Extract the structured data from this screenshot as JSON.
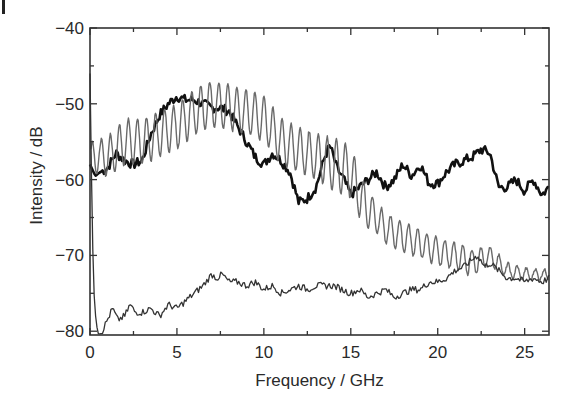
{
  "chart_data": {
    "type": "line",
    "title": "",
    "xlabel": "Frequency / GHz",
    "ylabel": "Intensity / dB",
    "xlim": [
      0,
      26.4
    ],
    "ylim": [
      -80.5,
      -40
    ],
    "xticks": [
      0,
      5,
      10,
      15,
      20,
      25
    ],
    "xtick_labels": [
      "0",
      "5",
      "10",
      "15",
      "20",
      "25"
    ],
    "yticks": [
      -40,
      -50,
      -60,
      -70,
      -80
    ],
    "ytick_labels": [
      "−40",
      "−50",
      "−60",
      "−70",
      "−80"
    ],
    "grid": false,
    "legend": "none",
    "series": [
      {
        "name": "thick-black",
        "color": "#111111",
        "width": 2.6,
        "x": [
          0,
          0.3,
          0.6,
          1,
          1.5,
          2,
          2.5,
          3,
          3.5,
          4,
          4.5,
          5,
          5.5,
          6,
          6.5,
          7,
          7.5,
          8,
          8.5,
          9,
          9.5,
          10,
          10.5,
          11,
          11.5,
          12,
          12.5,
          13,
          13.5,
          13.8,
          14.2,
          14.6,
          15,
          15.5,
          16,
          16.5,
          17,
          17.5,
          18,
          18.5,
          19,
          19.5,
          20,
          20.5,
          21,
          21.5,
          22,
          22.5,
          23,
          23.5,
          24,
          24.5,
          25,
          25.5,
          26,
          26.4
        ],
        "values": [
          -58,
          -59.5,
          -59,
          -58.5,
          -56.5,
          -57.5,
          -58,
          -57.5,
          -54,
          -51.5,
          -50,
          -49,
          -49.5,
          -49.5,
          -50,
          -50.5,
          -50.5,
          -51,
          -53,
          -55,
          -57,
          -58,
          -56.5,
          -57.5,
          -59,
          -63,
          -62.5,
          -61,
          -57,
          -55.5,
          -58.5,
          -60,
          -62,
          -61,
          -60,
          -59,
          -61,
          -60,
          -58,
          -59.5,
          -58,
          -60.5,
          -60.5,
          -59,
          -58,
          -57.5,
          -57,
          -56,
          -56.5,
          -61,
          -61,
          -60,
          -61.5,
          -60,
          -62,
          -61
        ]
      },
      {
        "name": "grey-oscillating",
        "color": "#6a6a6a",
        "width": 1.4,
        "envelope_mid": [
          -57,
          -57,
          -55,
          -55,
          -54,
          -53,
          -51,
          -50,
          -50.5,
          -51,
          -52,
          -55,
          -56,
          -57,
          -58,
          -59,
          -62,
          -64,
          -65,
          -66.5,
          -67.5,
          -68.5,
          -69.5,
          -70,
          -70.5,
          -71,
          -70.5,
          -70,
          -72,
          -72.5,
          -72.5
        ],
        "envelope_x": [
          0,
          1,
          2,
          3,
          4,
          5,
          6,
          7,
          8,
          9,
          10,
          11,
          12,
          13,
          14,
          15,
          15.5,
          16,
          16.5,
          17,
          18,
          19,
          20,
          21,
          21.5,
          22,
          22.5,
          23,
          24,
          25,
          26.4
        ],
        "amplitude": [
          2,
          2.5,
          3,
          3,
          3,
          3,
          3,
          3,
          3,
          3,
          3,
          3,
          3,
          3,
          3.5,
          3.5,
          3,
          2.5,
          2,
          2,
          2,
          1.8,
          1.8,
          1.8,
          1.8,
          1.8,
          1.5,
          1.2,
          1,
          0.8,
          0.6
        ],
        "period_ghz": 0.52
      },
      {
        "name": "thin-lower",
        "color": "#333333",
        "width": 1.3,
        "x": [
          0,
          0.1,
          0.2,
          0.35,
          0.5,
          0.7,
          1,
          1.3,
          1.6,
          2,
          2.3,
          2.6,
          3,
          3.5,
          4,
          4.5,
          5,
          5.5,
          6,
          6.5,
          7,
          7.3,
          7.6,
          8,
          8.5,
          9,
          9.5,
          10,
          10.5,
          11,
          11.5,
          12,
          12.5,
          13,
          13.5,
          14,
          14.5,
          15,
          15.5,
          16,
          16.5,
          17,
          17.5,
          18,
          18.5,
          19,
          19.5,
          20,
          20.5,
          21,
          21.5,
          22,
          22.3,
          22.7,
          23,
          23.5,
          24,
          24.5,
          25,
          25.5,
          26,
          26.4
        ],
        "values": [
          -46,
          -62,
          -74,
          -79,
          -80.5,
          -80,
          -78.5,
          -77,
          -78.5,
          -78,
          -76.5,
          -77.5,
          -77.5,
          -77,
          -78,
          -76.5,
          -77,
          -76,
          -75,
          -74,
          -72.5,
          -73,
          -72.5,
          -73.5,
          -73.5,
          -74,
          -73.5,
          -74.5,
          -74,
          -75,
          -74.5,
          -74,
          -74.5,
          -74,
          -74,
          -74,
          -74.5,
          -75,
          -74.5,
          -75.5,
          -75,
          -74.5,
          -75.5,
          -75,
          -74.5,
          -74.5,
          -73.5,
          -73.5,
          -73,
          -72,
          -71.5,
          -70.5,
          -70,
          -71.5,
          -71,
          -72,
          -73,
          -73,
          -73.5,
          -73,
          -73.5,
          -73
        ]
      }
    ]
  },
  "figure": {
    "panel_marker": "I"
  }
}
